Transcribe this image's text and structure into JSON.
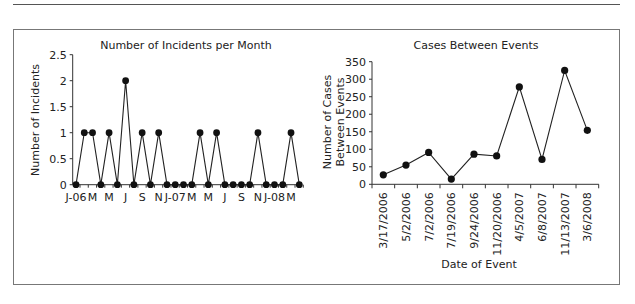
{
  "chart_data": [
    {
      "type": "line",
      "title": "Number of Incidents per Month",
      "xlabel": "",
      "ylabel": "Number of Incidents",
      "ylim": [
        0,
        2.5
      ],
      "yticks": [
        "0",
        "0.5",
        "1",
        "1.5",
        "2",
        "2.5"
      ],
      "x_tick_labels": [
        "J-06",
        "M",
        "M",
        "J",
        "S",
        "N",
        "J-07",
        "M",
        "M",
        "J",
        "S",
        "N",
        "J-08",
        "M"
      ],
      "categories": [
        "Jan-06",
        "Feb-06",
        "Mar-06",
        "Apr-06",
        "May-06",
        "Jun-06",
        "Jul-06",
        "Aug-06",
        "Sep-06",
        "Oct-06",
        "Nov-06",
        "Dec-06",
        "Jan-07",
        "Feb-07",
        "Mar-07",
        "Apr-07",
        "May-07",
        "Jun-07",
        "Jul-07",
        "Aug-07",
        "Sep-07",
        "Oct-07",
        "Nov-07",
        "Dec-07",
        "Jan-08",
        "Feb-08",
        "Mar-08",
        "Apr-08"
      ],
      "values": [
        0,
        1,
        1,
        0,
        1,
        0,
        2,
        0,
        1,
        0,
        1,
        0,
        0,
        0,
        0,
        1,
        0,
        1,
        0,
        0,
        0,
        0,
        1,
        0,
        0,
        0,
        1,
        0
      ],
      "grid": false,
      "legend": null
    },
    {
      "type": "line",
      "title": "Cases Between Events",
      "xlabel": "Date of Event",
      "ylabel": "Number of Cases Between Events",
      "ylabel_lines": [
        "Number of Cases",
        "Between Events"
      ],
      "ylim": [
        0,
        350
      ],
      "yticks": [
        "0",
        "50",
        "100",
        "150",
        "200",
        "250",
        "300",
        "350"
      ],
      "categories": [
        "3/17/2006",
        "5/2/2006",
        "7/2/2006",
        "7/19/2006",
        "9/24/2006",
        "11/20/2006",
        "4/5/2007",
        "6/8/2007",
        "11/13/2007",
        "3/6/2008"
      ],
      "values": [
        27,
        55,
        91,
        15,
        86,
        81,
        278,
        71,
        325,
        154
      ],
      "grid": false,
      "legend": null
    }
  ]
}
